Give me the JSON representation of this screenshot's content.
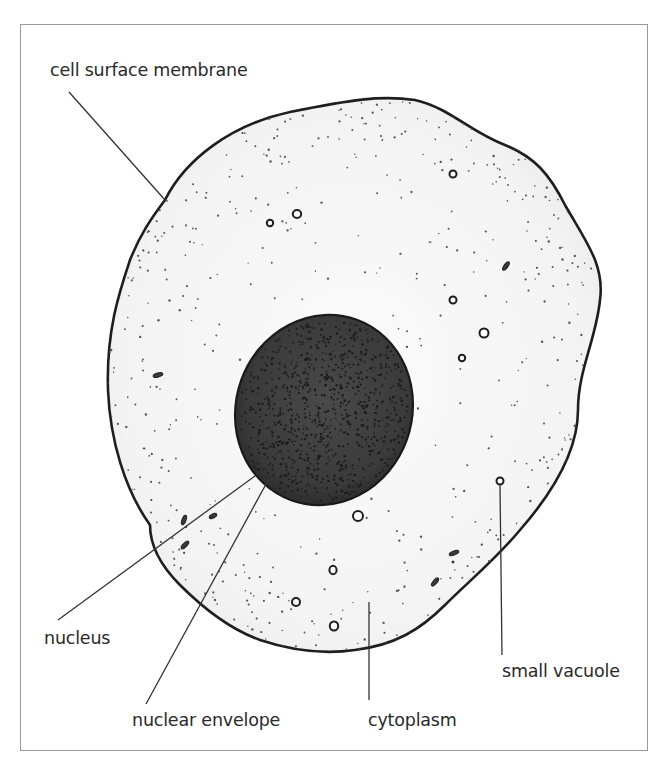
{
  "figure": {
    "type": "biological diagram",
    "colors": {
      "frame": "#9a9a9a",
      "outline": "#1e1e1e",
      "cytoplasm": "#f6f6f6",
      "nucleus": "#3c3c3c",
      "stipple": "#555555",
      "leader_line": "#333333",
      "text": "#2a2a2a"
    }
  },
  "labels": {
    "cell_surface_membrane": "cell surface membrane",
    "nucleus": "nucleus",
    "nuclear_envelope": "nuclear envelope",
    "cytoplasm": "cytoplasm",
    "small_vacuole": "small vacuole"
  }
}
